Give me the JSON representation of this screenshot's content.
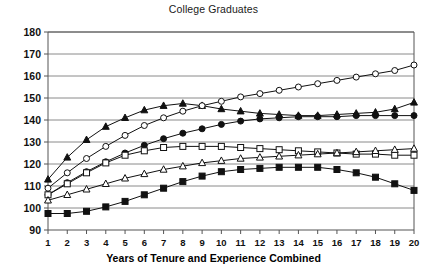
{
  "chart_data": {
    "type": "line",
    "title": "College Graduates",
    "xlabel": "Years of Tenure and Experience Combined",
    "ylabel": "",
    "xlim": [
      1,
      20
    ],
    "ylim": [
      90,
      180
    ],
    "ytick_step": 10,
    "grid": true,
    "legend_position": "none",
    "x": [
      1,
      2,
      3,
      4,
      5,
      6,
      7,
      8,
      9,
      10,
      11,
      12,
      13,
      14,
      15,
      16,
      17,
      18,
      19,
      20
    ],
    "xticklabels": [
      "1",
      "2",
      "3",
      "4",
      "5",
      "6",
      "7",
      "8",
      "9",
      "10",
      "11",
      "12",
      "13",
      "14",
      "15",
      "16",
      "17",
      "18",
      "19",
      "20"
    ],
    "yticklabels": [
      "90",
      "100",
      "110",
      "120",
      "130",
      "140",
      "150",
      "160",
      "170",
      "180"
    ],
    "yticks": [
      90,
      100,
      110,
      120,
      130,
      140,
      150,
      160,
      170,
      180
    ],
    "series": [
      {
        "name": "filled-triangle",
        "marker": "triangle-filled",
        "values": [
          113,
          123,
          131,
          137,
          141,
          144.5,
          146.5,
          147.5,
          146.5,
          145,
          144,
          143,
          142.5,
          142,
          142,
          142.5,
          143,
          143.5,
          145,
          148
        ]
      },
      {
        "name": "open-circle",
        "marker": "circle-open",
        "values": [
          109,
          116,
          122.5,
          128,
          133,
          137.5,
          141,
          144,
          146.5,
          148.5,
          150.5,
          152,
          153.5,
          155,
          156.5,
          158,
          159.5,
          161,
          162.5,
          165
        ]
      },
      {
        "name": "filled-circle",
        "marker": "circle-filled",
        "values": [
          106,
          111.5,
          116.5,
          121,
          125,
          128.5,
          131.5,
          134,
          136,
          138,
          139.5,
          140.5,
          141,
          141.5,
          141.5,
          141.5,
          142,
          142,
          142,
          142
        ]
      },
      {
        "name": "open-square",
        "marker": "square-open",
        "values": [
          106,
          111,
          116,
          120.5,
          124,
          126,
          127.5,
          128,
          128,
          128,
          127.5,
          127,
          126.5,
          126,
          125.5,
          125,
          124.5,
          124.5,
          124,
          124
        ]
      },
      {
        "name": "open-triangle",
        "marker": "triangle-open",
        "values": [
          103.5,
          106,
          108.5,
          111,
          113.5,
          115.5,
          117.5,
          119,
          120.5,
          121.5,
          122.5,
          123,
          123.5,
          124,
          124.5,
          125,
          125.5,
          126,
          126.5,
          127
        ]
      },
      {
        "name": "filled-square",
        "marker": "square-filled",
        "values": [
          97.5,
          97.5,
          98.5,
          100.5,
          103,
          106,
          109,
          112,
          114.5,
          116.5,
          117.5,
          118,
          118.5,
          118.5,
          118.5,
          117.5,
          116,
          114,
          111,
          108
        ]
      }
    ]
  }
}
